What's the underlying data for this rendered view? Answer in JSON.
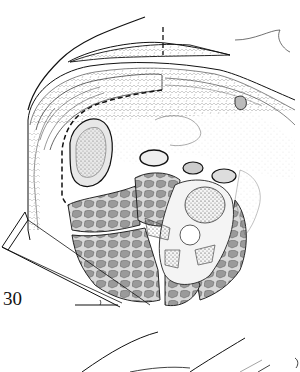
{
  "figure": {
    "number": "30",
    "type": "anatomical cross-section illustration",
    "elements": [
      "skin-outline",
      "subcutaneous-fat-layer",
      "abdominal-wall-muscle-layers",
      "dashed-incision-line",
      "peritoneum",
      "kidney",
      "bowel-loops",
      "vertebral-body",
      "paraspinal-muscles",
      "psoas-muscle",
      "positioning-wedge",
      "angle-marker",
      "second-figure-outline"
    ]
  },
  "colors": {
    "ink": "#111111",
    "muscle_fill": "#9a9a9a",
    "muscle_light": "#cfcfcf",
    "bone_stipple": "#555555",
    "background": "#ffffff"
  }
}
